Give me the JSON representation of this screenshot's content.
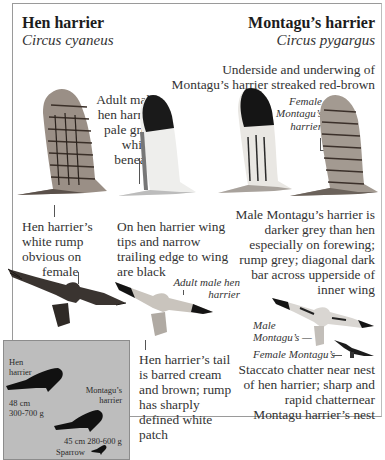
{
  "hen_harrier": {
    "title": "Hen harrier",
    "latin": "Circus cyaneus"
  },
  "montagus_harrier": {
    "title": "Montagu’s harrier",
    "latin": "Circus pygargus"
  },
  "captions": {
    "underside_montagu": [
      "Underside and underwing of",
      "Montagu’s harrier streaked red-brown"
    ],
    "adult_male_hen": [
      "Adult male",
      "hen harrier",
      "pale grey,",
      "whiter",
      "beneath"
    ],
    "female_montagu_label": [
      "Female",
      "Montagu’s",
      "harrier"
    ],
    "white_rump": [
      "Hen harrier’s",
      "white rump",
      "obvious on",
      "female"
    ],
    "wing_tips": [
      "On hen harrier wing",
      "tips and narrow",
      "trailing edge to wing",
      "are black"
    ],
    "male_montagu_darker": [
      "Male Montagu’s harrier is",
      "darker grey than hen",
      "especially on forewing;",
      "rump grey; diagonal dark",
      "bar across upperside of",
      "inner wing"
    ],
    "adult_male_hen_flight": [
      "Adult male hen",
      "harrier"
    ],
    "tail_barred": [
      "Hen harrier’s tail",
      "is barred cream",
      "and brown; rump",
      "has sharply",
      "defined white",
      "patch"
    ],
    "male_montagu_label": [
      "Male",
      "Montagu’s —"
    ],
    "female_montagu_flight": "Female Montagu’s",
    "call": [
      "Staccato chatter near nest",
      "of hen harrier; sharp and",
      "rapid chatternear",
      "Montagu harrier’s nest"
    ]
  },
  "size_comparison": {
    "hen_label": [
      "Hen",
      "harrier"
    ],
    "hen_size": [
      "48 cm",
      "300-700 g"
    ],
    "montagu_label": [
      "Montagu’s",
      "harrier"
    ],
    "montagu_size": "45 cm 280-600 g",
    "sparrow_label": "Sparrow"
  },
  "colors": {
    "inset_bg": "#bdbdbd",
    "frame": "#9a9a9a",
    "silhouette": "#111111",
    "female_hen_upper": "#3a3430",
    "male_hen_upper": "#c9c4bd"
  }
}
